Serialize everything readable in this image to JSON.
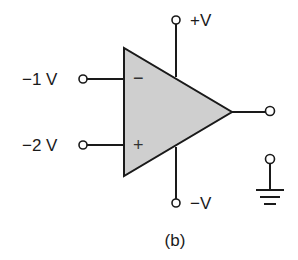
{
  "diagram": {
    "type": "op-amp circuit",
    "caption": "(b)",
    "colors": {
      "stroke": "#1a1a1a",
      "body_fill": "#cfcfcf",
      "background": "#ffffff"
    },
    "op_amp": {
      "inverting_symbol": "−",
      "noninverting_symbol": "+"
    },
    "terminals": {
      "inverting_input": {
        "label": "−1 V"
      },
      "noninverting_input": {
        "label": "−2 V"
      },
      "positive_supply": {
        "label": "+V"
      },
      "negative_supply": {
        "label": "−V"
      },
      "output": {
        "label": ""
      },
      "ground": {
        "label": ""
      }
    }
  }
}
